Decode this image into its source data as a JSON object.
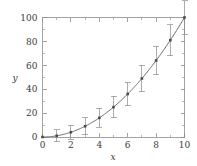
{
  "chart_data": {
    "type": "scatter",
    "title": "",
    "subtitle": "",
    "xlabel": "x",
    "ylabel": "y",
    "xlim": [
      0,
      10
    ],
    "ylim": [
      0,
      100
    ],
    "grid": false,
    "legend": null,
    "x_ticks": [
      0,
      2,
      4,
      6,
      8,
      10
    ],
    "x_tick_labels": [
      "0",
      "2",
      "4",
      "6",
      "8",
      "10"
    ],
    "x_minor_ticks": [
      1,
      3,
      5,
      7,
      9
    ],
    "y_ticks": [
      0,
      20,
      40,
      60,
      80,
      100
    ],
    "y_tick_labels": [
      "0",
      "20",
      "40",
      "60",
      "80",
      "100"
    ],
    "y_minor_ticks": [
      10,
      30,
      50,
      70,
      90
    ],
    "tick_direction": "in",
    "frame": "box",
    "series": [
      {
        "name": "measured",
        "marker": "square",
        "has_error_bars": true,
        "x": [
          0,
          1,
          2,
          3,
          4,
          5,
          6,
          7,
          8,
          9,
          10
        ],
        "values": [
          0,
          1,
          4,
          9,
          16,
          25,
          36,
          49,
          64,
          81,
          100
        ],
        "y_error": [
          0,
          5,
          6,
          7,
          8,
          9,
          10,
          11,
          12,
          13,
          14
        ]
      },
      {
        "name": "fit",
        "marker": "none",
        "line": "solid",
        "x": [
          0,
          1,
          2,
          3,
          4,
          5,
          6,
          7,
          8,
          9,
          10
        ],
        "values": [
          0,
          1,
          4,
          9,
          16,
          25,
          36,
          49,
          64,
          81,
          100
        ]
      }
    ],
    "colors": {
      "frame": "#8c8c8c",
      "curve": "#5a5a5a",
      "marker": "#4a4a4a",
      "errorbar": "#8a8a8a",
      "text": "#3a3a3a",
      "background": "#ffffff"
    }
  }
}
